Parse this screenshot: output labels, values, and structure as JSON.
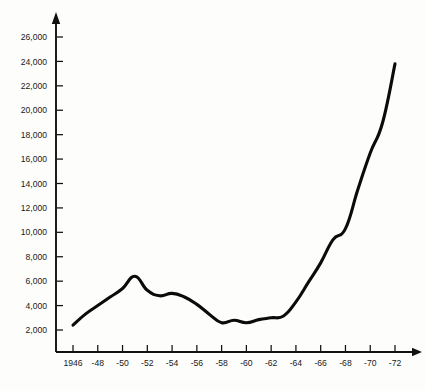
{
  "chart_data": {
    "type": "line",
    "title": "",
    "subtitle": "",
    "xlabel": "",
    "ylabel": "",
    "grid": false,
    "legend": false,
    "legend_position": "none",
    "line_color": "#0b0b0b",
    "background_color": "#fdfdfc",
    "axis_color": "#111111",
    "axis_style": "arrow-tipped L-shaped axes, ticks outside",
    "xlim": [
      1946,
      1972
    ],
    "ylim": [
      2000,
      26000
    ],
    "x": [
      1946,
      1947,
      1948,
      1949,
      1950,
      1951,
      1952,
      1953,
      1954,
      1955,
      1956,
      1957,
      1958,
      1959,
      1960,
      1961,
      1962,
      1963,
      1964,
      1965,
      1966,
      1967,
      1968,
      1969,
      1970,
      1971,
      1972
    ],
    "values": [
      2400,
      3300,
      4000,
      4700,
      5400,
      6400,
      5250,
      4800,
      5000,
      4700,
      4100,
      3300,
      2600,
      2800,
      2600,
      2850,
      3000,
      3150,
      4300,
      5900,
      7500,
      9400,
      10300,
      13500,
      16500,
      19000,
      23800
    ],
    "x_tick_values": [
      1946,
      1948,
      1950,
      1952,
      1954,
      1956,
      1958,
      1960,
      1962,
      1964,
      1966,
      1968,
      1970,
      1972
    ],
    "x_tick_labels": [
      "1946",
      "-48",
      "-50",
      "-52",
      "-54",
      "-56",
      "-58",
      "-60",
      "-62",
      "-64",
      "-66",
      "-68",
      "-70",
      "-72"
    ],
    "y_tick_values": [
      2000,
      4000,
      6000,
      8000,
      10000,
      12000,
      14000,
      16000,
      18000,
      20000,
      22000,
      24000,
      26000
    ],
    "y_tick_labels": [
      "2,000",
      "4,000",
      "6,000",
      "8,000",
      "10,000",
      "12,000",
      "14,000",
      "16,000",
      "18,000",
      "20,000",
      "22,000",
      "24,000",
      "26,000"
    ],
    "annotations": []
  }
}
